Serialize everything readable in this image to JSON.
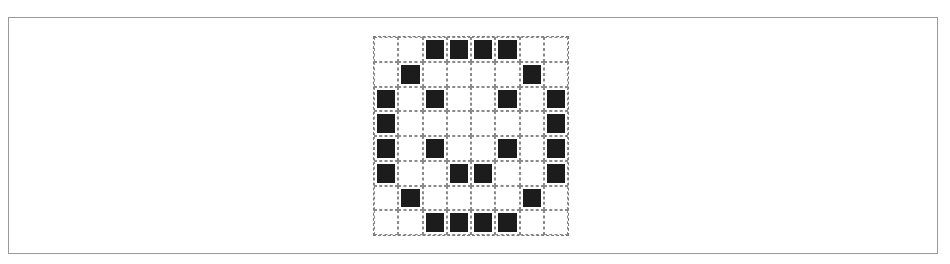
{
  "figure": {
    "rows": 8,
    "cols": 8,
    "colors": {
      "filled": "#1c1c1c",
      "empty": "#ffffff",
      "grid_line": "#8a8a8a",
      "frame": "#9a9a9a"
    },
    "pixels": [
      [
        0,
        0,
        1,
        1,
        1,
        1,
        0,
        0
      ],
      [
        0,
        1,
        0,
        0,
        0,
        0,
        1,
        0
      ],
      [
        1,
        0,
        1,
        0,
        0,
        1,
        0,
        1
      ],
      [
        1,
        0,
        0,
        0,
        0,
        0,
        0,
        1
      ],
      [
        1,
        0,
        1,
        0,
        0,
        1,
        0,
        1
      ],
      [
        1,
        0,
        0,
        1,
        1,
        0,
        0,
        1
      ],
      [
        0,
        1,
        0,
        0,
        0,
        0,
        1,
        0
      ],
      [
        0,
        0,
        1,
        1,
        1,
        1,
        0,
        0
      ]
    ]
  }
}
